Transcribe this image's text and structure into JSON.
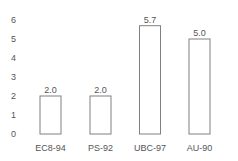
{
  "chart_data": {
    "type": "bar",
    "title": "",
    "xlabel": "",
    "ylabel": "",
    "categories": [
      "EC8-94",
      "PS-92",
      "UBC-97",
      "AU-90"
    ],
    "values": [
      2.0,
      2.0,
      5.7,
      5.0
    ],
    "value_labels": [
      "2.0",
      "2.0",
      "5.7",
      "5.0"
    ],
    "ylim": [
      0,
      6
    ],
    "yticks": [
      0,
      1,
      2,
      3,
      4,
      5,
      6
    ],
    "grid": false,
    "legend": null,
    "colors": {
      "bar_fill": "#ffffff",
      "bar_stroke": "#808080",
      "text": "#555555"
    }
  }
}
